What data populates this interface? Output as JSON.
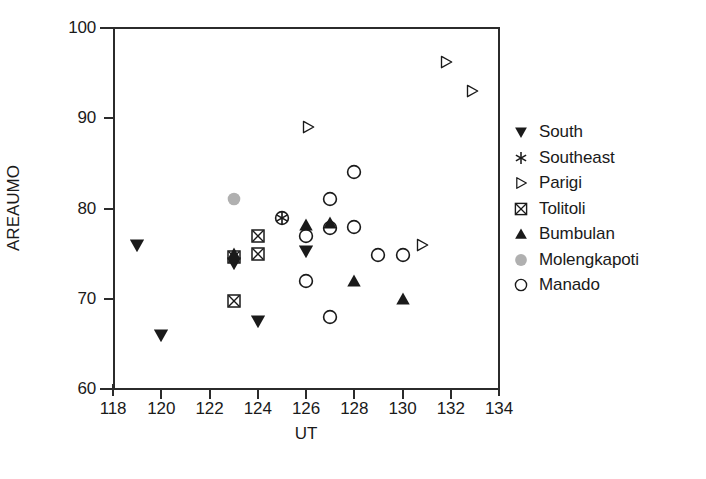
{
  "chart_data": {
    "type": "scatter",
    "title": "",
    "xlabel": "UT",
    "ylabel": "AREAUMO",
    "xlim": [
      118,
      134
    ],
    "ylim": [
      60,
      100
    ],
    "xticks": [
      118,
      120,
      122,
      124,
      126,
      128,
      130,
      132,
      134
    ],
    "yticks": [
      60,
      70,
      80,
      90,
      100
    ],
    "grid": false,
    "legend_position": "right",
    "colors": {
      "ink": "#1a1a1a",
      "axis": "#2b2b2b",
      "molengkapoti_gray": "#b0b0b0"
    },
    "series": [
      {
        "name": "South",
        "marker": "filled-down-triangle",
        "color": "#1a1a1a",
        "points": [
          {
            "x": 119.0,
            "y": 76.0
          },
          {
            "x": 120.0,
            "y": 66.0
          },
          {
            "x": 123.0,
            "y": 74.0
          },
          {
            "x": 124.0,
            "y": 67.5
          },
          {
            "x": 126.0,
            "y": 75.3
          }
        ]
      },
      {
        "name": "Southeast",
        "marker": "asterisk",
        "color": "#1a1a1a",
        "points": [
          {
            "x": 125.0,
            "y": 79.0
          }
        ]
      },
      {
        "name": "Parigi",
        "marker": "open-right-triangle",
        "color": "#1a1a1a",
        "points": [
          {
            "x": 126.1,
            "y": 89.0
          },
          {
            "x": 130.8,
            "y": 76.0
          },
          {
            "x": 131.8,
            "y": 96.2
          },
          {
            "x": 132.9,
            "y": 93.0
          }
        ]
      },
      {
        "name": "Tolitoli",
        "marker": "crossed-square",
        "color": "#1a1a1a",
        "points": [
          {
            "x": 123.0,
            "y": 74.6
          },
          {
            "x": 123.0,
            "y": 69.8
          },
          {
            "x": 124.0,
            "y": 77.0
          },
          {
            "x": 124.0,
            "y": 75.0
          }
        ]
      },
      {
        "name": "Bumbulan",
        "marker": "filled-up-triangle",
        "color": "#1a1a1a",
        "points": [
          {
            "x": 123.0,
            "y": 75.0
          },
          {
            "x": 126.0,
            "y": 78.2
          },
          {
            "x": 127.0,
            "y": 78.4
          },
          {
            "x": 128.0,
            "y": 72.0
          },
          {
            "x": 130.0,
            "y": 70.0
          }
        ]
      },
      {
        "name": "Molengkapoti",
        "marker": "filled-gray-circle",
        "color": "#b0b0b0",
        "points": [
          {
            "x": 123.0,
            "y": 81.0
          }
        ]
      },
      {
        "name": "Manado",
        "marker": "open-circle",
        "color": "#1a1a1a",
        "points": [
          {
            "x": 125.0,
            "y": 79.0
          },
          {
            "x": 126.0,
            "y": 77.0
          },
          {
            "x": 126.0,
            "y": 72.0
          },
          {
            "x": 127.0,
            "y": 81.0
          },
          {
            "x": 127.0,
            "y": 77.8
          },
          {
            "x": 127.0,
            "y": 68.0
          },
          {
            "x": 128.0,
            "y": 84.0
          },
          {
            "x": 128.0,
            "y": 78.0
          },
          {
            "x": 129.0,
            "y": 74.8
          },
          {
            "x": 130.0,
            "y": 74.8
          }
        ]
      }
    ]
  },
  "legend": {
    "items": [
      {
        "label": "South",
        "marker": "filled-down-triangle"
      },
      {
        "label": "Southeast",
        "marker": "asterisk"
      },
      {
        "label": "Parigi",
        "marker": "open-right-triangle"
      },
      {
        "label": "Tolitoli",
        "marker": "crossed-square"
      },
      {
        "label": "Bumbulan",
        "marker": "filled-up-triangle"
      },
      {
        "label": "Molengkapoti",
        "marker": "filled-gray-circle"
      },
      {
        "label": "Manado",
        "marker": "open-circle"
      }
    ]
  }
}
